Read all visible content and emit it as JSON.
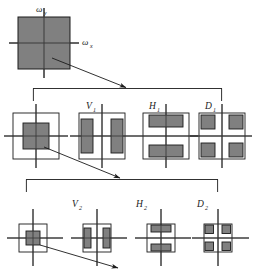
{
  "figure": {
    "background_color": "#ffffff",
    "line_color": "#1a1a1a",
    "fill_color": "#808080",
    "axes": {
      "x_label": "ω",
      "x_sub": "x",
      "y_label": "ω",
      "y_sub": "y"
    },
    "levels": [
      {
        "name": "level-0",
        "blocks": [
          {
            "id": "root",
            "label": "",
            "sub": "",
            "pattern": "solid"
          }
        ]
      },
      {
        "name": "level-1",
        "blocks": [
          {
            "id": "A1",
            "label": "",
            "sub": "",
            "pattern": "center"
          },
          {
            "id": "V1",
            "label": "V",
            "sub": "1",
            "pattern": "vertical"
          },
          {
            "id": "H1",
            "label": "H",
            "sub": "1",
            "pattern": "horizontal"
          },
          {
            "id": "D1",
            "label": "D",
            "sub": "1",
            "pattern": "diagonal"
          }
        ]
      },
      {
        "name": "level-2",
        "blocks": [
          {
            "id": "A2",
            "label": "",
            "sub": "",
            "pattern": "center"
          },
          {
            "id": "V2",
            "label": "V",
            "sub": "2",
            "pattern": "vertical"
          },
          {
            "id": "H2",
            "label": "H",
            "sub": "2",
            "pattern": "horizontal"
          },
          {
            "id": "D2",
            "label": "D",
            "sub": "2",
            "pattern": "diagonal"
          }
        ]
      }
    ],
    "labels": {
      "omega_y": "ω",
      "omega_y_sub": "y",
      "omega_x": "ω",
      "omega_x_sub": "x",
      "v1": "V",
      "v1_sub": "1",
      "h1": "H",
      "h1_sub": "1",
      "d1": "D",
      "d1_sub": "1",
      "v2": "V",
      "v2_sub": "2",
      "h2": "H",
      "h2_sub": "2",
      "d2": "D",
      "d2_sub": "2"
    }
  }
}
